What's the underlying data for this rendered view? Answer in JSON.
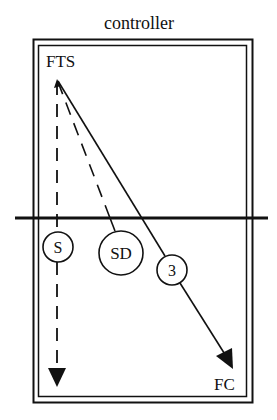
{
  "title": "controller",
  "nodes": {
    "origin": {
      "label": "FTS"
    },
    "target": {
      "label": "FC"
    },
    "circle_s": {
      "label": "S"
    },
    "circle_sd": {
      "label": "SD"
    },
    "circle_3": {
      "label": "3"
    }
  },
  "colors": {
    "ink": "#111111",
    "background": "#ffffff"
  }
}
